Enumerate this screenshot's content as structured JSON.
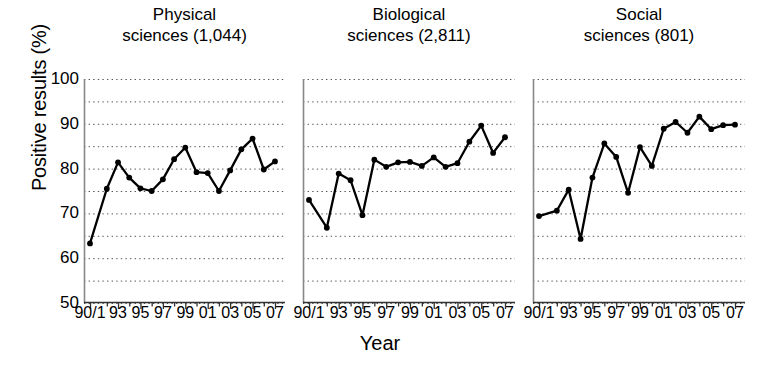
{
  "chart_data": {
    "type": "line",
    "title": "",
    "xlabel": "Year",
    "ylabel": "Positive results (%)",
    "ylim": [
      50,
      100
    ],
    "yticks": [
      50,
      60,
      70,
      80,
      90,
      100
    ],
    "yticklabels": [
      "50",
      "60",
      "70",
      "80",
      "90",
      "100"
    ],
    "y_minor_step": 5,
    "grid": "horizontal-dotted",
    "legend": "none",
    "marker": "filled-circle",
    "line_color": "#000000",
    "x": [
      1990.5,
      1992,
      1993,
      1994,
      1995,
      1996,
      1997,
      1998,
      1999,
      2000,
      2001,
      2002,
      2003,
      2004,
      2005,
      2006,
      2007
    ],
    "xticklabels": [
      "90/1",
      "93",
      "95",
      "97",
      "99",
      "01",
      "03",
      "05",
      "07"
    ],
    "xtick_values": [
      1990.5,
      1993,
      1995,
      1997,
      1999,
      2001,
      2003,
      2005,
      2007
    ],
    "panels": [
      {
        "name": "physical",
        "title": "Physical\nsciences (1,044)",
        "discipline": "Physical sciences",
        "n": "1,044",
        "values": [
          63.3,
          75.5,
          81.4,
          78.0,
          75.6,
          75.0,
          77.6,
          82.1,
          84.7,
          79.2,
          79.0,
          75.0,
          79.6,
          84.3,
          86.7,
          79.8,
          81.6
        ]
      },
      {
        "name": "biological",
        "title": "Biological\nsciences (2,811)",
        "discipline": "Biological sciences",
        "n": "2,811",
        "values": [
          73.0,
          66.8,
          78.9,
          77.4,
          69.6,
          82.0,
          80.4,
          81.4,
          81.5,
          80.6,
          82.5,
          80.4,
          81.2,
          86.0,
          89.6,
          83.5,
          87.0
        ]
      },
      {
        "name": "social",
        "title": "Social\nsciences (801)",
        "discipline": "Social sciences",
        "n": "801",
        "values": [
          69.4,
          70.6,
          75.3,
          64.3,
          78.0,
          85.6,
          82.6,
          74.6,
          84.8,
          80.6,
          88.9,
          90.4,
          88.0,
          91.6,
          88.8,
          89.7,
          89.8
        ]
      }
    ]
  }
}
